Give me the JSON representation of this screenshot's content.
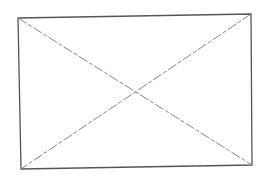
{
  "diagram": {
    "type": "image-placeholder",
    "shape": "rectangle-with-crossed-diagonals",
    "corners": {
      "top_left": [
        18,
        18
      ],
      "top_right": [
        251,
        14
      ],
      "bottom_right": [
        252,
        165
      ],
      "bottom_left": [
        21,
        169
      ]
    },
    "colors": {
      "background": "#ffffff",
      "frame": "#555555",
      "diagonals": "#777777"
    },
    "diagonal_style": "dash-dot"
  }
}
